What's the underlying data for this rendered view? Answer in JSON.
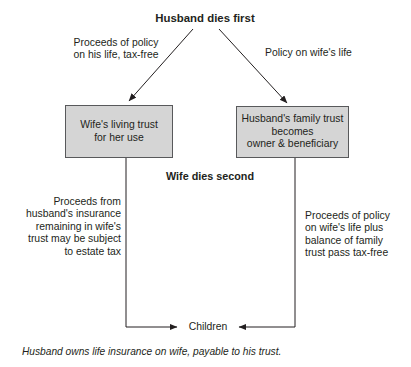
{
  "diagram": {
    "title": "Husband dies first",
    "second_event": "Wife dies second",
    "edge_labels": {
      "left_top": "Proceeds of policy\non his life, tax-free",
      "right_top": "Policy on wife's life",
      "left_bottom": "Proceeds from\nhusband's insurance\nremaining in wife's\ntrust may be subject\nto estate tax",
      "right_bottom": "Proceeds of policy\non wife's life plus\nbalance of family\ntrust pass tax-free"
    },
    "boxes": [
      {
        "id": "wife-living-trust",
        "label": "Wife's living trust\nfor her use"
      },
      {
        "id": "husband-family-trust",
        "label": "Husband's family trust\nbecomes\nowner & beneficiary"
      }
    ],
    "terminal": "Children",
    "footnote": "Husband owns life insurance on wife, payable to his trust.",
    "colors": {
      "box_fill": "#d5d5d5",
      "box_border": "#58595b",
      "line": "#231f20",
      "text": "#231f20",
      "background": "#ffffff"
    }
  }
}
